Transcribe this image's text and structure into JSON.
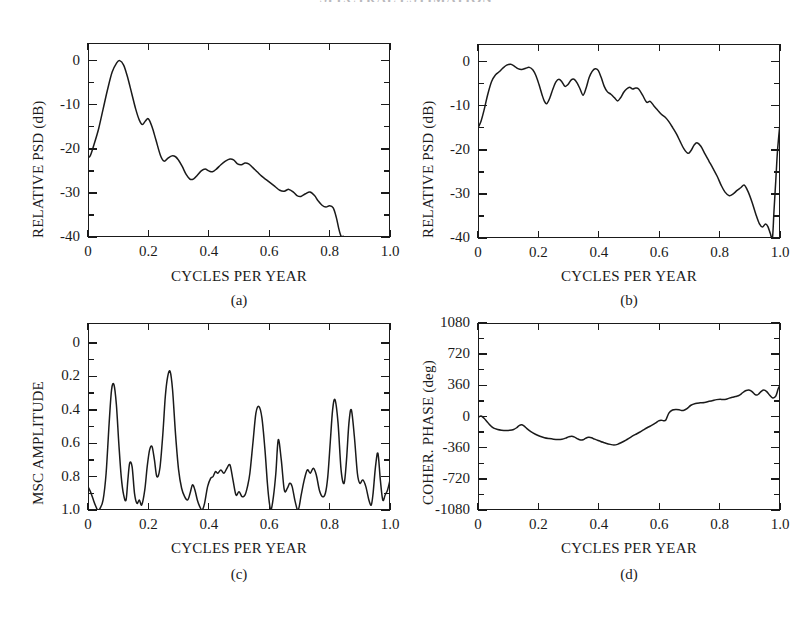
{
  "page": {
    "header_text": "SPECTRAL ESTIMATION"
  },
  "figure": {
    "shared_xlabel": "CYCLES PER YEAR",
    "panels": [
      {
        "id": "a",
        "caption": "(a)",
        "ylabel": "RELATIVE PSD (dB)",
        "xlabel": "CYCLES PER YEAR",
        "xticklabels": [
          "0",
          "0.2",
          "0.4",
          "0.6",
          "0.8",
          "1.0"
        ],
        "yticklabels": [
          "0",
          "-10",
          "-20",
          "-30",
          "-40"
        ]
      },
      {
        "id": "b",
        "caption": "(b)",
        "ylabel": "RELATIVE PSD (dB)",
        "xlabel": "CYCLES PER YEAR",
        "xticklabels": [
          "0",
          "0.2",
          "0.4",
          "0.6",
          "0.8",
          "1.0"
        ],
        "yticklabels": [
          "0",
          "-10",
          "-20",
          "-30",
          "-40"
        ]
      },
      {
        "id": "c",
        "caption": "(c)",
        "ylabel": "MSC AMPLITUDE",
        "xlabel": "CYCLES PER YEAR",
        "xticklabels": [
          "0",
          "0.2",
          "0.4",
          "0.6",
          "0.8",
          "1.0"
        ],
        "yticklabels": [
          "1.0",
          "0.8",
          "0.6",
          "0.4",
          "0.2",
          "0"
        ]
      },
      {
        "id": "d",
        "caption": "(d)",
        "ylabel": "COHER. PHASE (deg)",
        "xlabel": "CYCLES PER YEAR",
        "xticklabels": [
          "0",
          "0.2",
          "0.4",
          "0.6",
          "0.8",
          "1.0"
        ],
        "yticklabels": [
          "1080",
          "720",
          "360",
          "0",
          "-360",
          "-720",
          "-1080"
        ]
      }
    ]
  },
  "chart_data": [
    {
      "type": "line",
      "panel": "a",
      "title": "(a)",
      "xlabel": "CYCLES PER YEAR",
      "ylabel": "RELATIVE PSD (dB)",
      "xlim": [
        0.0,
        1.0
      ],
      "ylim": [
        -40,
        4
      ],
      "xticks": [
        0.0,
        0.2,
        0.4,
        0.6,
        0.8,
        1.0
      ],
      "yticks": [
        0,
        -10,
        -20,
        -30,
        -40
      ],
      "minor_ticks": true,
      "grid": false,
      "legend": null,
      "x": [
        0.0,
        0.008,
        0.02,
        0.035,
        0.05,
        0.065,
        0.08,
        0.095,
        0.105,
        0.118,
        0.13,
        0.145,
        0.158,
        0.17,
        0.18,
        0.19,
        0.2,
        0.212,
        0.225,
        0.24,
        0.252,
        0.265,
        0.278,
        0.29,
        0.3,
        0.312,
        0.325,
        0.338,
        0.35,
        0.362,
        0.375,
        0.388,
        0.4,
        0.412,
        0.425,
        0.44,
        0.455,
        0.47,
        0.482,
        0.495,
        0.508,
        0.52,
        0.532,
        0.545,
        0.56,
        0.575,
        0.59,
        0.605,
        0.62,
        0.635,
        0.65,
        0.665,
        0.68,
        0.692,
        0.705,
        0.72,
        0.735,
        0.75,
        0.762,
        0.775,
        0.788,
        0.8,
        0.812,
        0.822,
        0.83,
        0.836,
        0.84
      ],
      "y": [
        -22.0,
        -21.5,
        -19.0,
        -15.5,
        -11.0,
        -6.5,
        -2.6,
        -0.5,
        0.0,
        -1.0,
        -3.5,
        -7.5,
        -11.0,
        -13.5,
        -14.5,
        -13.7,
        -13.2,
        -15.0,
        -18.0,
        -21.5,
        -22.8,
        -22.1,
        -21.6,
        -21.8,
        -22.6,
        -24.0,
        -25.8,
        -26.9,
        -26.8,
        -26.0,
        -25.0,
        -24.6,
        -25.0,
        -25.2,
        -24.6,
        -23.6,
        -22.8,
        -22.3,
        -22.5,
        -23.4,
        -23.6,
        -23.2,
        -23.4,
        -24.2,
        -25.2,
        -26.2,
        -27.0,
        -27.8,
        -28.6,
        -29.4,
        -29.6,
        -29.2,
        -29.8,
        -30.6,
        -30.8,
        -30.2,
        -29.8,
        -30.6,
        -31.8,
        -32.8,
        -33.2,
        -32.9,
        -33.4,
        -35.5,
        -38.0,
        -39.5,
        -40.0
      ]
    },
    {
      "type": "line",
      "panel": "b",
      "title": "(b)",
      "xlabel": "CYCLES PER YEAR",
      "ylabel": "RELATIVE PSD (dB)",
      "xlim": [
        0.0,
        1.0
      ],
      "ylim": [
        -40,
        4
      ],
      "xticks": [
        0.0,
        0.2,
        0.4,
        0.6,
        0.8,
        1.0
      ],
      "yticks": [
        0,
        -10,
        -20,
        -30,
        -40
      ],
      "minor_ticks": true,
      "grid": false,
      "legend": null,
      "x": [
        0.0,
        0.01,
        0.02,
        0.032,
        0.045,
        0.058,
        0.07,
        0.082,
        0.095,
        0.108,
        0.12,
        0.132,
        0.145,
        0.158,
        0.17,
        0.182,
        0.192,
        0.202,
        0.212,
        0.22,
        0.228,
        0.238,
        0.248,
        0.258,
        0.268,
        0.278,
        0.288,
        0.298,
        0.308,
        0.318,
        0.328,
        0.338,
        0.348,
        0.358,
        0.368,
        0.378,
        0.388,
        0.398,
        0.408,
        0.418,
        0.428,
        0.44,
        0.452,
        0.462,
        0.472,
        0.482,
        0.492,
        0.502,
        0.512,
        0.522,
        0.532,
        0.545,
        0.558,
        0.57,
        0.582,
        0.595,
        0.608,
        0.62,
        0.632,
        0.645,
        0.658,
        0.67,
        0.682,
        0.695,
        0.705,
        0.715,
        0.725,
        0.738,
        0.752,
        0.765,
        0.778,
        0.792,
        0.805,
        0.818,
        0.832,
        0.845,
        0.858,
        0.87,
        0.882,
        0.895,
        0.908,
        0.92,
        0.932,
        0.942,
        0.952,
        0.96,
        0.968,
        0.975,
        0.98,
        0.986,
        0.992,
        1.0
      ],
      "y": [
        -15.0,
        -13.5,
        -11.0,
        -7.5,
        -4.5,
        -3.0,
        -2.3,
        -1.5,
        -0.8,
        -0.6,
        -1.0,
        -1.6,
        -1.8,
        -1.5,
        -1.3,
        -1.9,
        -3.2,
        -5.2,
        -7.5,
        -9.0,
        -9.5,
        -8.2,
        -6.2,
        -4.6,
        -4.0,
        -4.6,
        -5.6,
        -5.2,
        -4.2,
        -4.0,
        -4.8,
        -6.2,
        -7.6,
        -6.0,
        -3.6,
        -2.2,
        -1.6,
        -2.0,
        -3.6,
        -5.6,
        -6.8,
        -7.4,
        -8.2,
        -8.9,
        -8.2,
        -7.0,
        -6.2,
        -5.8,
        -6.2,
        -6.0,
        -6.2,
        -7.6,
        -9.2,
        -9.0,
        -10.0,
        -11.0,
        -12.0,
        -12.6,
        -13.6,
        -15.0,
        -16.5,
        -18.2,
        -19.8,
        -20.8,
        -20.2,
        -19.0,
        -18.4,
        -19.2,
        -21.0,
        -22.6,
        -24.2,
        -26.0,
        -28.0,
        -29.6,
        -30.4,
        -30.0,
        -29.2,
        -28.6,
        -28.0,
        -29.6,
        -32.0,
        -34.6,
        -36.8,
        -37.5,
        -36.8,
        -37.4,
        -39.0,
        -40.0,
        -34.0,
        -27.0,
        -20.0,
        -14.0
      ]
    },
    {
      "type": "line",
      "panel": "c",
      "title": "(c)",
      "xlabel": "CYCLES PER YEAR",
      "ylabel": "MSC AMPLITUDE",
      "xlim": [
        0.0,
        1.0
      ],
      "ylim": [
        0.0,
        1.12
      ],
      "xticks": [
        0.0,
        0.2,
        0.4,
        0.6,
        0.8,
        1.0
      ],
      "yticks": [
        0,
        0.2,
        0.4,
        0.6,
        0.8,
        1.0
      ],
      "minor_ticks": true,
      "grid": false,
      "legend": null,
      "x": [
        0.0,
        0.008,
        0.016,
        0.024,
        0.032,
        0.04,
        0.05,
        0.06,
        0.07,
        0.078,
        0.086,
        0.094,
        0.102,
        0.11,
        0.118,
        0.126,
        0.132,
        0.138,
        0.146,
        0.154,
        0.162,
        0.17,
        0.178,
        0.188,
        0.196,
        0.204,
        0.212,
        0.22,
        0.228,
        0.238,
        0.248,
        0.256,
        0.264,
        0.272,
        0.28,
        0.29,
        0.3,
        0.31,
        0.32,
        0.33,
        0.338,
        0.346,
        0.354,
        0.362,
        0.37,
        0.378,
        0.386,
        0.396,
        0.406,
        0.414,
        0.422,
        0.43,
        0.44,
        0.45,
        0.46,
        0.47,
        0.48,
        0.49,
        0.5,
        0.51,
        0.52,
        0.528,
        0.536,
        0.546,
        0.556,
        0.566,
        0.576,
        0.586,
        0.594,
        0.6,
        0.606,
        0.614,
        0.622,
        0.63,
        0.64,
        0.65,
        0.66,
        0.668,
        0.676,
        0.686,
        0.696,
        0.706,
        0.716,
        0.726,
        0.736,
        0.746,
        0.756,
        0.766,
        0.776,
        0.786,
        0.794,
        0.802,
        0.81,
        0.818,
        0.828,
        0.838,
        0.848,
        0.856,
        0.864,
        0.872,
        0.882,
        0.892,
        0.9,
        0.91,
        0.92,
        0.93,
        0.938,
        0.944,
        0.952,
        0.96,
        0.968,
        0.976,
        0.984,
        0.992,
        1.0
      ],
      "y": [
        0.14,
        0.11,
        0.07,
        0.03,
        0.0,
        0.01,
        0.06,
        0.22,
        0.52,
        0.72,
        0.75,
        0.63,
        0.4,
        0.2,
        0.09,
        0.06,
        0.18,
        0.28,
        0.26,
        0.1,
        0.04,
        0.06,
        0.03,
        0.12,
        0.26,
        0.36,
        0.38,
        0.3,
        0.2,
        0.25,
        0.46,
        0.68,
        0.8,
        0.83,
        0.72,
        0.45,
        0.24,
        0.13,
        0.08,
        0.06,
        0.1,
        0.15,
        0.12,
        0.06,
        0.02,
        0.0,
        0.04,
        0.14,
        0.19,
        0.2,
        0.23,
        0.22,
        0.24,
        0.22,
        0.25,
        0.27,
        0.18,
        0.09,
        0.11,
        0.08,
        0.09,
        0.14,
        0.22,
        0.4,
        0.58,
        0.62,
        0.55,
        0.36,
        0.16,
        0.05,
        0.0,
        0.08,
        0.22,
        0.42,
        0.3,
        0.12,
        0.13,
        0.16,
        0.14,
        0.05,
        0.0,
        0.09,
        0.18,
        0.24,
        0.22,
        0.25,
        0.21,
        0.12,
        0.08,
        0.1,
        0.2,
        0.4,
        0.6,
        0.66,
        0.52,
        0.24,
        0.16,
        0.3,
        0.52,
        0.6,
        0.44,
        0.22,
        0.16,
        0.18,
        0.14,
        0.06,
        0.03,
        0.1,
        0.26,
        0.34,
        0.18,
        0.06,
        0.09,
        0.12,
        0.18
      ]
    },
    {
      "type": "line",
      "panel": "d",
      "title": "(d)",
      "xlabel": "CYCLES PER YEAR",
      "ylabel": "COHER. PHASE (deg)",
      "xlim": [
        0.0,
        1.0
      ],
      "ylim": [
        -1080,
        1080
      ],
      "xticks": [
        0.0,
        0.2,
        0.4,
        0.6,
        0.8,
        1.0
      ],
      "yticks": [
        1080,
        720,
        360,
        0,
        -360,
        -720,
        -1080
      ],
      "minor_ticks": true,
      "grid": false,
      "legend": null,
      "x": [
        0.0,
        0.01,
        0.02,
        0.03,
        0.04,
        0.052,
        0.065,
        0.078,
        0.092,
        0.105,
        0.118,
        0.128,
        0.136,
        0.144,
        0.152,
        0.162,
        0.175,
        0.19,
        0.205,
        0.22,
        0.235,
        0.25,
        0.265,
        0.278,
        0.29,
        0.3,
        0.31,
        0.32,
        0.33,
        0.34,
        0.348,
        0.356,
        0.366,
        0.376,
        0.386,
        0.396,
        0.406,
        0.416,
        0.426,
        0.438,
        0.45,
        0.462,
        0.475,
        0.49,
        0.505,
        0.52,
        0.535,
        0.548,
        0.56,
        0.572,
        0.582,
        0.59,
        0.598,
        0.606,
        0.614,
        0.622,
        0.632,
        0.644,
        0.656,
        0.666,
        0.674,
        0.682,
        0.692,
        0.705,
        0.72,
        0.735,
        0.75,
        0.765,
        0.778,
        0.79,
        0.802,
        0.812,
        0.822,
        0.832,
        0.842,
        0.852,
        0.862,
        0.872,
        0.88,
        0.888,
        0.896,
        0.904,
        0.912,
        0.918,
        0.924,
        0.93,
        0.938,
        0.946,
        0.956,
        0.966,
        0.976,
        0.986,
        0.994,
        1.0
      ],
      "y": [
        -10,
        5,
        -20,
        -60,
        -100,
        -135,
        -150,
        -158,
        -162,
        -160,
        -150,
        -130,
        -105,
        -95,
        -108,
        -140,
        -175,
        -205,
        -228,
        -245,
        -255,
        -262,
        -265,
        -262,
        -250,
        -235,
        -228,
        -238,
        -258,
        -272,
        -268,
        -252,
        -240,
        -245,
        -262,
        -275,
        -288,
        -300,
        -312,
        -322,
        -330,
        -322,
        -300,
        -272,
        -240,
        -210,
        -182,
        -155,
        -130,
        -108,
        -88,
        -70,
        -50,
        -42,
        -48,
        -40,
        40,
        75,
        82,
        78,
        70,
        72,
        90,
        130,
        150,
        158,
        162,
        175,
        186,
        195,
        198,
        196,
        200,
        212,
        222,
        230,
        240,
        262,
        285,
        300,
        306,
        296,
        272,
        252,
        248,
        262,
        290,
        305,
        288,
        245,
        215,
        235,
        320,
        360
      ]
    }
  ]
}
